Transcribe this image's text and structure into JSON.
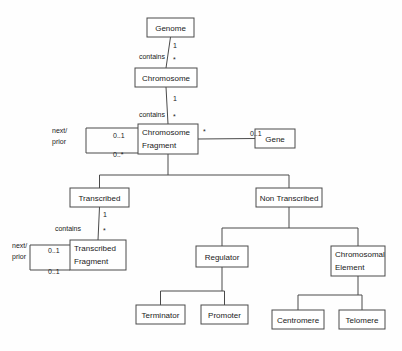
{
  "diagram": {
    "type": "uml-class-diagram",
    "background_color": "#fefefe",
    "line_color": "#4a4a4a",
    "box_fill": "#ffffff",
    "text_color": "#1a1a1a",
    "classes": [
      {
        "id": "genome",
        "label": "Genome",
        "lines": [
          "Genome"
        ],
        "x": 147,
        "y": 18,
        "w": 47,
        "h": 19,
        "align": "center"
      },
      {
        "id": "chromosome",
        "label": "Chromosome",
        "lines": [
          "Chromosome"
        ],
        "x": 135,
        "y": 68,
        "w": 62,
        "h": 19,
        "align": "center"
      },
      {
        "id": "chromosome-fragment",
        "label": "Chromosome Fragment",
        "lines": [
          "Chromosome",
          "Fragment"
        ],
        "x": 138,
        "y": 124,
        "w": 60,
        "h": 30,
        "align": "left"
      },
      {
        "id": "gene",
        "label": "Gene",
        "lines": [
          "Gene"
        ],
        "x": 255,
        "y": 129,
        "w": 40,
        "h": 19,
        "align": "center"
      },
      {
        "id": "transcribed",
        "label": "Transcribed",
        "lines": [
          "Transcribed"
        ],
        "x": 70,
        "y": 188,
        "w": 59,
        "h": 19,
        "align": "center"
      },
      {
        "id": "non-transcribed",
        "label": "Non Transcribed",
        "lines": [
          "Non Transcribed"
        ],
        "x": 256,
        "y": 188,
        "w": 66,
        "h": 19,
        "align": "center"
      },
      {
        "id": "transcribed-fragment",
        "label": "Transcribed Fragment",
        "lines": [
          "Transcribed",
          "Fragment"
        ],
        "x": 70,
        "y": 240,
        "w": 56,
        "h": 30,
        "align": "left"
      },
      {
        "id": "regulator",
        "label": "Regulator",
        "lines": [
          "Regulator"
        ],
        "x": 196,
        "y": 246,
        "w": 52,
        "h": 21,
        "align": "center"
      },
      {
        "id": "chromosomal-element",
        "label": "Chromosomal Element",
        "lines": [
          "Chromosomal",
          "Element"
        ],
        "x": 331,
        "y": 246,
        "w": 54,
        "h": 30,
        "align": "left"
      },
      {
        "id": "terminator",
        "label": "Terminator",
        "lines": [
          "Terminator"
        ],
        "x": 136,
        "y": 305,
        "w": 49,
        "h": 19,
        "align": "center"
      },
      {
        "id": "promoter",
        "label": "Promoter",
        "lines": [
          "Promoter"
        ],
        "x": 201,
        "y": 305,
        "w": 47,
        "h": 19,
        "align": "center"
      },
      {
        "id": "centromere",
        "label": "Centromere",
        "lines": [
          "Centromere"
        ],
        "x": 272,
        "y": 310,
        "w": 52,
        "h": 19,
        "align": "center"
      },
      {
        "id": "telomere",
        "label": "Telomere",
        "lines": [
          "Telomere"
        ],
        "x": 339,
        "y": 310,
        "w": 46,
        "h": 19,
        "align": "center"
      }
    ],
    "associations": [
      {
        "id": "genome-contains-chromosome",
        "from": "genome",
        "to": "chromosome",
        "label": "contains",
        "label_x": 165,
        "label_y": 59,
        "source_mult": "1",
        "source_mult_x": 173,
        "source_mult_y": 48,
        "target_mult": "*",
        "target_mult_x": 173,
        "target_mult_y": 62
      },
      {
        "id": "chromosome-contains-fragment",
        "from": "chromosome",
        "to": "chromosome-fragment",
        "label": "contains",
        "label_x": 165,
        "label_y": 117,
        "source_mult": "1",
        "source_mult_x": 173,
        "source_mult_y": 101,
        "target_mult": "*",
        "target_mult_x": 173,
        "target_mult_y": 119
      },
      {
        "id": "fragment-gene",
        "from": "chromosome-fragment",
        "to": "gene",
        "label": "",
        "source_mult": "*",
        "source_mult_x": 203,
        "source_mult_y": 134,
        "target_mult": "0..1",
        "target_mult_x": 250,
        "target_mult_y": 136
      },
      {
        "id": "transcribed-contains-fragment",
        "from": "transcribed",
        "to": "transcribed-fragment",
        "label": "contains",
        "label_x": 81,
        "label_y": 231,
        "source_mult": "1",
        "source_mult_x": 103,
        "source_mult_y": 217,
        "target_mult": "*",
        "target_mult_x": 103,
        "target_mult_y": 233
      }
    ],
    "self_associations": [
      {
        "id": "fragment-next-prior",
        "on": "chromosome-fragment",
        "role_label": "next/\nprior",
        "role_lines": [
          "next/",
          "prior"
        ],
        "role_x": 52,
        "role_y": 133,
        "near_mult": "0..1",
        "near_mult_x": 113,
        "near_mult_y": 138,
        "far_mult": "0..*",
        "far_mult_x": 113,
        "far_mult_y": 157,
        "loop_left": 86,
        "loop_top": 128,
        "loop_bottom": 153
      },
      {
        "id": "transcribed-fragment-next-prior",
        "on": "transcribed-fragment",
        "role_label": "next/\nprior",
        "role_lines": [
          "next/",
          "prior"
        ],
        "role_x": 12,
        "role_y": 248,
        "near_mult": "0..1",
        "near_mult_x": 48,
        "near_mult_y": 253,
        "far_mult": "0..1",
        "far_mult_x": 48,
        "far_mult_y": 274,
        "loop_left": 30,
        "loop_top": 245,
        "loop_bottom": 270
      }
    ],
    "generalizations": [
      {
        "id": "fragment-subtypes",
        "parent": "chromosome-fragment",
        "children": [
          "transcribed",
          "non-transcribed"
        ],
        "bus_y": 175
      },
      {
        "id": "non-transcribed-subtypes",
        "parent": "non-transcribed",
        "children": [
          "regulator",
          "chromosomal-element"
        ],
        "bus_y": 228
      },
      {
        "id": "regulator-subtypes",
        "parent": "regulator",
        "children": [
          "terminator",
          "promoter"
        ],
        "bus_y": 291
      },
      {
        "id": "chromosomal-element-subtypes",
        "parent": "chromosomal-element",
        "children": [
          "centromere",
          "telomere"
        ],
        "bus_y": 295
      }
    ]
  }
}
